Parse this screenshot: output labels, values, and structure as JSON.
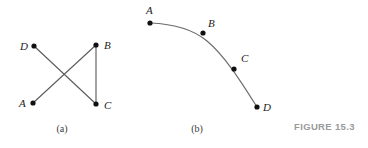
{
  "figure": {
    "number_label": "FIGURE 15.3",
    "background_color": "#ffffff",
    "edge_color": "#5d5d5d",
    "curve_color": "#6b6b6b",
    "dot_color": "#111111",
    "label_color": "#1c1c1c",
    "caption_color": "#9a9a9a"
  },
  "panel_a": {
    "caption": "(a)",
    "caption_x": 62,
    "caption_y": 132,
    "vertices": [
      {
        "id": "D",
        "label": "D",
        "x": 34,
        "y": 46,
        "label_x": 20,
        "label_y": 50
      },
      {
        "id": "B",
        "label": "B",
        "x": 96,
        "y": 45,
        "label_x": 104,
        "label_y": 49
      },
      {
        "id": "A",
        "label": "A",
        "x": 33,
        "y": 103,
        "label_x": 19,
        "label_y": 107
      },
      {
        "id": "C",
        "label": "C",
        "x": 96,
        "y": 104,
        "label_x": 104,
        "label_y": 109
      }
    ],
    "edges": [
      {
        "from": "D",
        "to": "C",
        "x1": 34,
        "y1": 46,
        "x2": 96,
        "y2": 104
      },
      {
        "from": "A",
        "to": "B",
        "x1": 33,
        "y1": 103,
        "x2": 96,
        "y2": 45
      },
      {
        "from": "B",
        "to": "C",
        "x1": 96,
        "y1": 45,
        "x2": 96,
        "y2": 104
      }
    ]
  },
  "panel_b": {
    "caption": "(b)",
    "caption_x": 197,
    "caption_y": 132,
    "curve_path": "M 150 23 C 176 24 194 30 207 41 C 224 55 240 80 257 107",
    "vertices": [
      {
        "id": "A",
        "label": "A",
        "x": 150,
        "y": 23,
        "label_x": 146,
        "label_y": 14
      },
      {
        "id": "B",
        "label": "B",
        "x": 203,
        "y": 33,
        "label_x": 208,
        "label_y": 27
      },
      {
        "id": "C",
        "label": "C",
        "x": 234,
        "y": 69,
        "label_x": 241,
        "label_y": 62
      },
      {
        "id": "D",
        "label": "D",
        "x": 257,
        "y": 107,
        "label_x": 263,
        "label_y": 111
      }
    ]
  },
  "figure_caption": {
    "text": "FIGURE 15.3",
    "x": 294,
    "y": 130
  }
}
